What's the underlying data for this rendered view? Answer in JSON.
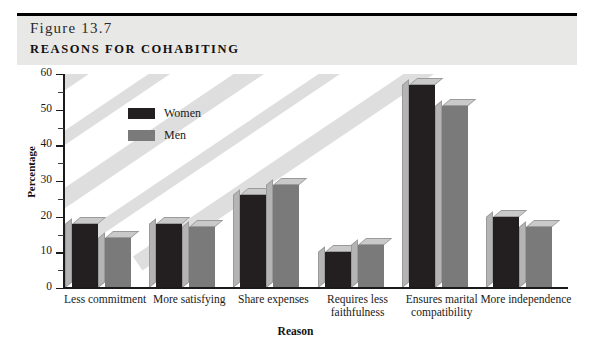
{
  "header": {
    "figure_number": "Figure 13.7",
    "title": "Reasons for Cohabiting"
  },
  "colors": {
    "women": "#231f20",
    "men": "#7a7a7a",
    "bar_top": "#c9c9c9",
    "bar_side": "#b4b4b4",
    "header_band": "#e8e8e6",
    "stripe": "#dedede",
    "axis": "#1a1a1a"
  },
  "legend": {
    "position": "inside-top-left",
    "entries": [
      {
        "label": "Women",
        "color": "#231f20",
        "swatch": "legend-swatch-women"
      },
      {
        "label": "Men",
        "color": "#7a7a7a",
        "swatch": "legend-swatch-men"
      }
    ]
  },
  "chart_data": {
    "type": "bar",
    "title": "Reasons for Cohabiting",
    "xlabel": "Reason",
    "ylabel": "Percentage",
    "ylim": [
      0,
      60
    ],
    "yticks": [
      0,
      10,
      20,
      30,
      40,
      50,
      60
    ],
    "ytick_labels": [
      "0",
      "10",
      "20",
      "30",
      "40",
      "50",
      "60"
    ],
    "yminor_ticks": [
      5,
      15,
      25,
      35,
      45,
      55
    ],
    "grid": false,
    "categories": [
      "Less commitment",
      "More satisfying",
      "Share expenses",
      "Requires less faithfulness",
      "Ensures marital compatibility",
      "More independence"
    ],
    "series": [
      {
        "name": "Women",
        "color": "#231f20",
        "values": [
          18,
          18,
          26,
          10,
          57,
          20
        ]
      },
      {
        "name": "Men",
        "color": "#7a7a7a",
        "values": [
          14,
          17,
          29,
          12,
          51,
          17
        ]
      }
    ]
  }
}
